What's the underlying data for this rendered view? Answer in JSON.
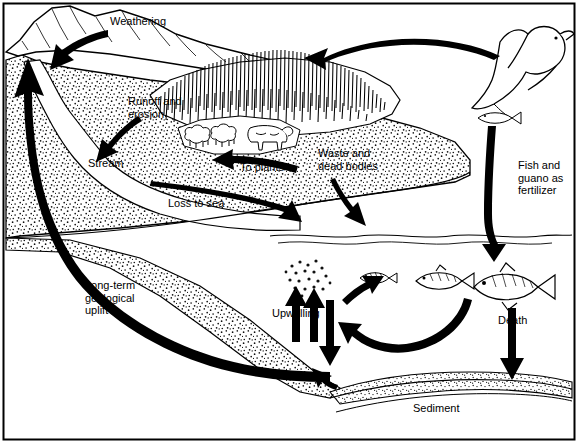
{
  "diagram": {
    "type": "nutrient-cycle-illustration",
    "border_color": "#000000",
    "ink_color": "#000000",
    "background_color": "#ffffff",
    "labels": [
      {
        "id": "weathering",
        "text": "Weathering",
        "x": 110,
        "y": 22
      },
      {
        "id": "runoff-erosion",
        "text": "Runoff and\nerosion",
        "x": 128,
        "y": 101
      },
      {
        "id": "stream",
        "text": "Stream",
        "x": 88,
        "y": 163
      },
      {
        "id": "to-plants",
        "text": "To plants",
        "x": 240,
        "y": 167
      },
      {
        "id": "waste-dead-bodies",
        "text": "Waste and\ndead bodies",
        "x": 318,
        "y": 153
      },
      {
        "id": "loss-to-sea",
        "text": "Loss to sea",
        "x": 168,
        "y": 203
      },
      {
        "id": "fish-guano",
        "text": "Fish and\nguano as\nfertilizer",
        "x": 518,
        "y": 165
      },
      {
        "id": "long-term-uplift",
        "text": "Long-term\ngeological\nuplift",
        "x": 85,
        "y": 285
      },
      {
        "id": "upwelling",
        "text": "Upwelling",
        "x": 272,
        "y": 313
      },
      {
        "id": "death",
        "text": "Death",
        "x": 498,
        "y": 320
      },
      {
        "id": "sediment",
        "text": "Sediment",
        "x": 413,
        "y": 408
      }
    ],
    "elements": [
      {
        "id": "mountain",
        "name": "mountain-range"
      },
      {
        "id": "forest",
        "name": "forest-vegetation-patch"
      },
      {
        "id": "grazing-animals",
        "name": "grazing-cattle-and-sheep"
      },
      {
        "id": "seabird",
        "name": "flying-seabird"
      },
      {
        "id": "plankton",
        "name": "plankton-dots"
      },
      {
        "id": "fish-small",
        "name": "small-fish"
      },
      {
        "id": "fish-medium",
        "name": "medium-fish"
      },
      {
        "id": "fish-large",
        "name": "large-fish"
      },
      {
        "id": "sediment-layer",
        "name": "ocean-floor-sediment"
      },
      {
        "id": "stream-channel",
        "name": "stream-channel"
      },
      {
        "id": "ocean",
        "name": "ocean-water-body"
      }
    ]
  }
}
